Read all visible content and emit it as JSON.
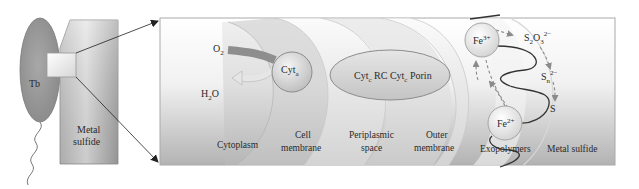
{
  "figure": {
    "overview": {
      "cell_label": "Tb",
      "mineral_label_line1": "Metal",
      "mineral_label_line2": "sulfide"
    },
    "detail": {
      "oxygen": {
        "base": "O",
        "sub": "2"
      },
      "water": {
        "base1": "H",
        "sub": "2",
        "base2": "O"
      },
      "cyt_a": {
        "base": "Cyt",
        "sub": "a"
      },
      "complex": {
        "part1": "Cyt",
        "part1_sub": "c",
        "part2": " RC Cyt",
        "part2_sub": "c",
        "part3": " Porin"
      },
      "iron3": {
        "base": "Fe",
        "sup": "3+"
      },
      "iron2": {
        "base": "Fe",
        "sup": "2+"
      },
      "thiosulfate": {
        "base1": "S",
        "sub1": "2",
        "base2": "O",
        "sub2": "3",
        "sup": "2−"
      },
      "polysulfide": {
        "base": "S",
        "sub": "n",
        "sup": "2−"
      },
      "sulfur": "S",
      "regions": [
        {
          "id": "cytoplasm",
          "line1": "Cytoplasm",
          "line2": ""
        },
        {
          "id": "cell-membrane",
          "line1": "Cell",
          "line2": "membrane"
        },
        {
          "id": "periplasmic-space",
          "line1": "Periplasmic",
          "line2": "space"
        },
        {
          "id": "outer-membrane",
          "line1": "Outer",
          "line2": "membrane"
        },
        {
          "id": "exopolymers",
          "line1": "Exopolymers",
          "line2": ""
        },
        {
          "id": "metal-sulfide",
          "line1": "Metal sulfide",
          "line2": ""
        }
      ]
    },
    "colors": {
      "panel_top": "#ffffff",
      "panel_bottom": "#b5b5b5",
      "cell_fill": "#9a9a9a",
      "arrow_band": "#8e8e8e",
      "dashed_arrow": "#8a8a8a",
      "exopolymer_line": "#333333"
    }
  }
}
